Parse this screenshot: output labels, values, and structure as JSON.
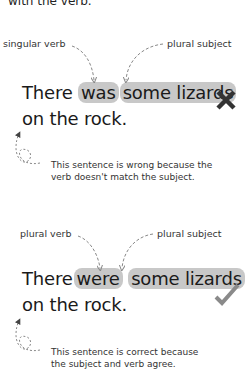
{
  "intro": {
    "text": "with the verb."
  },
  "example_wrong": {
    "label_verb": "singular verb",
    "label_subject": "plural subject",
    "sentence_start": "There",
    "verb": "was",
    "subject": "some lizards",
    "sentence_end": "on the rock.",
    "mark": "cross-icon",
    "explanation_line1": "This sentence is wrong because the",
    "explanation_line2": "verb doesn't match the subject."
  },
  "example_right": {
    "label_verb": "plural verb",
    "label_subject": "plural subject",
    "sentence_start": "There",
    "verb": "were",
    "subject": "some lizards",
    "sentence_end": "on the rock.",
    "mark": "checkmark-icon",
    "explanation_line1": "This sentence is correct because",
    "explanation_line2": "the subject and verb agree."
  },
  "colors": {
    "highlight": "#c8c8c8",
    "cross": "#333333",
    "check": "#8a8a8a",
    "arrow": "#888888"
  }
}
